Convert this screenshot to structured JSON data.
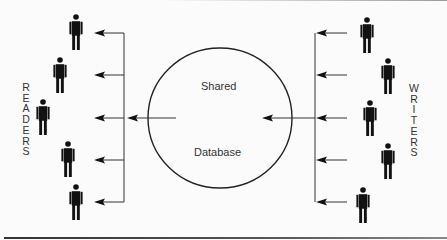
{
  "diagram": {
    "colors": {
      "ink": "#111111",
      "line": "#333333",
      "background": "#fbfbfb",
      "text": "#333333"
    },
    "database": {
      "line1": "Shared",
      "line2": "Database",
      "cx": 220,
      "cy": 118,
      "rx": 72,
      "ry": 70
    },
    "readers": {
      "label": "READERS",
      "letters": [
        "R",
        "E",
        "A",
        "D",
        "E",
        "R",
        "S"
      ],
      "bus_x": 124,
      "bus_y_top": 33,
      "bus_y_bottom": 202,
      "figures": [
        {
          "x": 76,
          "y": 17,
          "arrow_y": 33
        },
        {
          "x": 60,
          "y": 60,
          "arrow_y": 75
        },
        {
          "x": 43,
          "y": 102,
          "arrow_y": 118
        },
        {
          "x": 68,
          "y": 144,
          "arrow_y": 160
        },
        {
          "x": 76,
          "y": 187,
          "arrow_y": 202
        }
      ]
    },
    "writers": {
      "label": "WRITERS",
      "letters": [
        "W",
        "R",
        "I",
        "T",
        "E",
        "R",
        "S"
      ],
      "bus_x": 315,
      "bus_y_top": 33,
      "bus_y_bottom": 202,
      "figures": [
        {
          "x": 367,
          "y": 20,
          "arrow_y": 33
        },
        {
          "x": 388,
          "y": 61,
          "arrow_y": 75
        },
        {
          "x": 370,
          "y": 103,
          "arrow_y": 118
        },
        {
          "x": 388,
          "y": 146,
          "arrow_y": 160
        },
        {
          "x": 363,
          "y": 190,
          "arrow_y": 202
        }
      ]
    },
    "flows": [
      {
        "from": "writers",
        "to": "database",
        "direction": "left"
      },
      {
        "from": "database",
        "to": "readers",
        "direction": "left"
      }
    ]
  }
}
